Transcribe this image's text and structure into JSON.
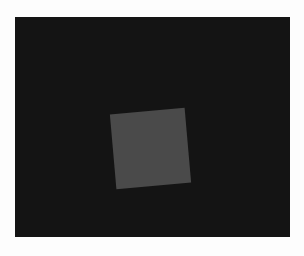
{
  "scene": {
    "description": "Gray square rotated slightly on dark background",
    "background_color": "#141414",
    "square_color": "#4a4a4a",
    "page_color": "#fdfdfd"
  }
}
